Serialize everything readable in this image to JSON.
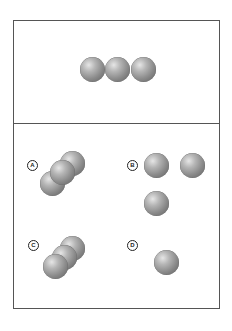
{
  "panels": {
    "top": {
      "description": "three spheres in a horizontal row",
      "spheres": [
        {
          "x": 92,
          "y": 69
        },
        {
          "x": 117,
          "y": 69
        },
        {
          "x": 143,
          "y": 69
        }
      ]
    },
    "options": [
      {
        "label": "A",
        "spheres": [
          {
            "x": 72,
            "y": 163
          },
          {
            "x": 52,
            "y": 183
          },
          {
            "x": 62,
            "y": 172
          }
        ]
      },
      {
        "label": "B",
        "spheres": [
          {
            "x": 156,
            "y": 165
          },
          {
            "x": 192,
            "y": 165
          },
          {
            "x": 156,
            "y": 203
          }
        ]
      },
      {
        "label": "C",
        "spheres": [
          {
            "x": 72,
            "y": 248
          },
          {
            "x": 64,
            "y": 257
          },
          {
            "x": 55,
            "y": 266
          }
        ]
      },
      {
        "label": "D",
        "spheres": [
          {
            "x": 166,
            "y": 262
          }
        ]
      }
    ]
  },
  "colors": {
    "border": "#555555",
    "sphere": "#8a8a8a"
  }
}
